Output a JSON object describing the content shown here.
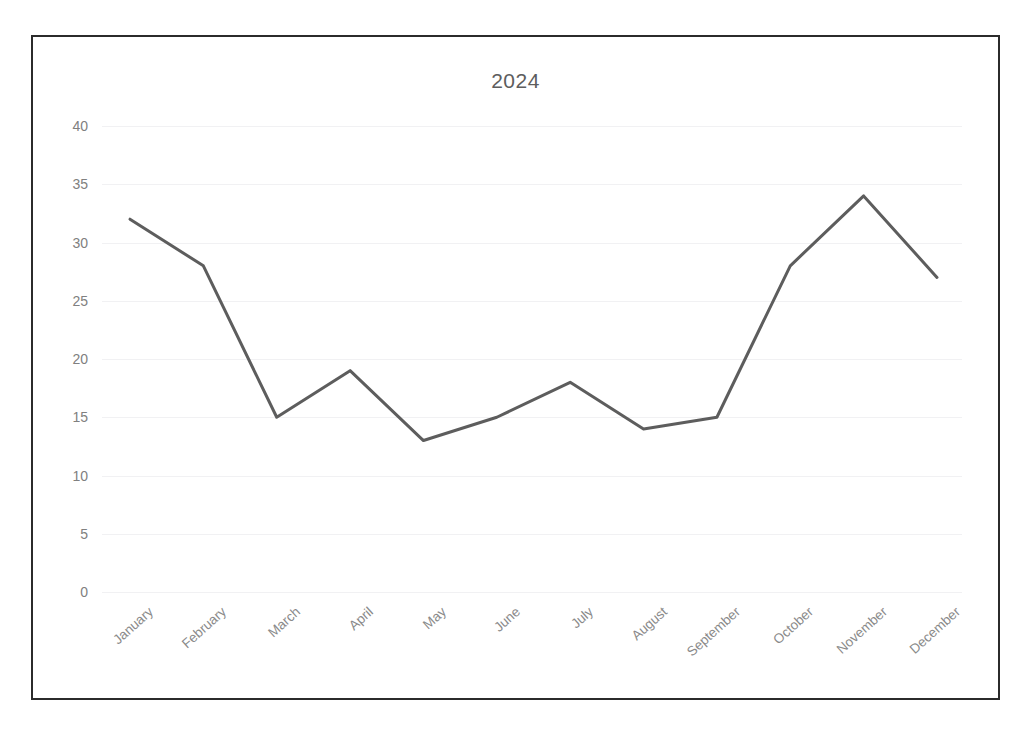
{
  "chart_data": {
    "type": "line",
    "title": "2024",
    "xlabel": "",
    "ylabel": "",
    "categories": [
      "January",
      "February",
      "March",
      "April",
      "May",
      "June",
      "July",
      "August",
      "September",
      "October",
      "November",
      "December"
    ],
    "values": [
      32,
      28,
      15,
      19,
      13,
      15,
      18,
      14,
      15,
      28,
      34,
      27
    ],
    "series": [
      {
        "name": "2024",
        "values": [
          32,
          28,
          15,
          19,
          13,
          15,
          18,
          14,
          15,
          28,
          34,
          27
        ]
      }
    ],
    "ylim": [
      0,
      40
    ],
    "yticks": [
      0,
      5,
      10,
      15,
      20,
      25,
      30,
      35,
      40
    ],
    "ytick_labels": [
      "0",
      "5",
      "10",
      "15",
      "20",
      "25",
      "30",
      "35",
      "40"
    ],
    "grid": "horizontal",
    "legend": "none",
    "xtick_rotation": -42,
    "colors": {
      "line": "#5d5d5d",
      "grid": "#f1f1f3",
      "tick_text": "#808080",
      "xtick_text": "#8a8a8a",
      "title_text": "#5d5d5d",
      "frame_border": "#2b2b2b",
      "background": "#ffffff"
    },
    "line_width": 3
  }
}
